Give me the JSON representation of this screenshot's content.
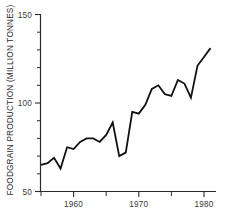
{
  "chart_data": {
    "type": "line",
    "title": "",
    "subtitle": "",
    "xlabel": "",
    "ylabel": "FOODGRAIN PRODUCTION (MILLION TONNES)",
    "xlim": [
      1955,
      1981
    ],
    "ylim": [
      50,
      150
    ],
    "grid": false,
    "legend": null,
    "x_ticks_major": [
      1960,
      1970,
      1980
    ],
    "x_tick_labels": [
      "1960",
      "1970",
      "1980"
    ],
    "x_ticks_minor": [
      1955,
      1965,
      1975
    ],
    "y_ticks_major": [
      50,
      100,
      150
    ],
    "y_tick_labels": [
      "50",
      "100",
      "150"
    ],
    "y_ticks_minor": [
      60,
      70,
      80,
      90,
      110,
      120,
      130,
      140
    ],
    "line_color": "#111111",
    "line_width": 1.8,
    "x": [
      1955,
      1956,
      1957,
      1958,
      1959,
      1960,
      1961,
      1962,
      1963,
      1964,
      1965,
      1966,
      1967,
      1968,
      1969,
      1970,
      1971,
      1972,
      1973,
      1974,
      1975,
      1976,
      1977,
      1978,
      1979,
      1980,
      1981
    ],
    "values": [
      65,
      66,
      69,
      63,
      75,
      74,
      78,
      80,
      80,
      78,
      82,
      89,
      70,
      72,
      95,
      94,
      99,
      108,
      110,
      105,
      104,
      113,
      111,
      103,
      121,
      126,
      131
    ],
    "series": [
      {
        "name": "Foodgrain production",
        "values": [
          65,
          66,
          69,
          63,
          75,
          74,
          78,
          80,
          80,
          78,
          82,
          89,
          70,
          72,
          95,
          94,
          99,
          108,
          110,
          105,
          104,
          113,
          111,
          103,
          121,
          126,
          131
        ]
      }
    ],
    "annotations": []
  },
  "axes": {
    "y_axis_name": "y-axis",
    "x_axis_name": "x-axis"
  }
}
